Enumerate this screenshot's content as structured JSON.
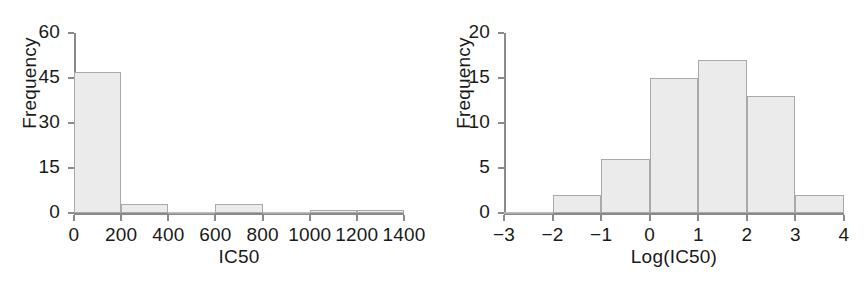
{
  "figure": {
    "background": "#ffffff",
    "bar_fill": "#ebebeb",
    "bar_edge": "#a9a9a9",
    "axis_color": "#8a8a8a",
    "text_color": "#1a1a1a"
  },
  "chart_data": [
    {
      "type": "bar",
      "title": "",
      "xlabel": "IC50",
      "ylabel": "Frequency",
      "xlim": [
        0,
        1400
      ],
      "ylim": [
        0,
        60
      ],
      "xticks": [
        0,
        200,
        400,
        600,
        800,
        1000,
        1200,
        1400
      ],
      "xtick_labels": [
        "0",
        "200",
        "400",
        "600",
        "800",
        "1000",
        "1200",
        "1400"
      ],
      "yticks": [
        0,
        15,
        30,
        45,
        60
      ],
      "ytick_labels": [
        "0",
        "15",
        "30",
        "45",
        "60"
      ],
      "grid": false,
      "legend": "none",
      "bin_edges": [
        0,
        200,
        400,
        600,
        800,
        1000,
        1200,
        1400
      ],
      "categories": [
        "0-200",
        "200-400",
        "400-600",
        "600-800",
        "800-1000",
        "1000-1200",
        "1200-1400"
      ],
      "values": [
        47,
        3,
        0,
        3,
        0,
        1,
        1
      ]
    },
    {
      "type": "bar",
      "title": "",
      "xlabel": "Log(IC50)",
      "ylabel": "Frequency",
      "xlim": [
        -3,
        4
      ],
      "ylim": [
        0,
        20
      ],
      "xticks": [
        -3,
        -2,
        -1,
        0,
        1,
        2,
        3,
        4
      ],
      "xtick_labels": [
        "−3",
        "−2",
        "−1",
        "0",
        "1",
        "2",
        "3",
        "4"
      ],
      "yticks": [
        0,
        5,
        10,
        15,
        20
      ],
      "ytick_labels": [
        "0",
        "5",
        "10",
        "15",
        "20"
      ],
      "grid": false,
      "legend": "none",
      "bin_edges": [
        -3,
        -2,
        -1,
        0,
        1,
        2,
        3,
        4
      ],
      "categories": [
        "-3 to -2",
        "-2 to -1",
        "-1 to 0",
        "0 to 1",
        "1 to 2",
        "2 to 3",
        "3 to 4"
      ],
      "values": [
        0,
        2,
        6,
        15,
        17,
        13,
        2
      ]
    }
  ]
}
